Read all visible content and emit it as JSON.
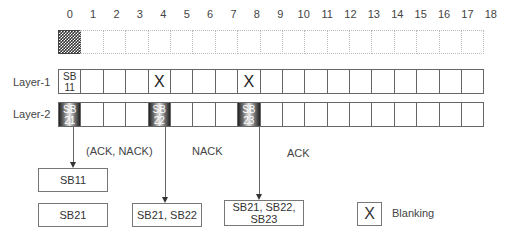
{
  "indices": [
    "0",
    "1",
    "2",
    "3",
    "4",
    "5",
    "6",
    "7",
    "8",
    "9",
    "10",
    "11",
    "12",
    "13",
    "14",
    "15",
    "16",
    "17",
    "18"
  ],
  "top_row": {
    "patterned_cell": 0,
    "patterned_label": "G"
  },
  "layers": [
    {
      "label": "Layer-1",
      "cells": [
        {
          "index": 0,
          "type": "sb",
          "line1": "SB",
          "line2": "11"
        },
        {
          "index": 4,
          "type": "blank",
          "mark": "X"
        },
        {
          "index": 8,
          "type": "blank",
          "mark": "X"
        }
      ]
    },
    {
      "label": "Layer-2",
      "cells": [
        {
          "index": 0,
          "type": "sb-shaded",
          "line1": "SB",
          "line2": "21"
        },
        {
          "index": 4,
          "type": "sb-shaded",
          "line1": "SB",
          "line2": "22"
        },
        {
          "index": 8,
          "type": "sb-shaded",
          "line1": "SB",
          "line2": "23"
        }
      ]
    }
  ],
  "feedback": [
    {
      "label": "(ACK, NACK)"
    },
    {
      "label": "NACK"
    },
    {
      "label": "ACK"
    }
  ],
  "buffers": [
    {
      "text": "SB11"
    },
    {
      "text": "SB21"
    },
    {
      "text": "SB21, SB22"
    },
    {
      "line1": "SB21, SB22,",
      "line2": "SB23"
    }
  ],
  "legend": {
    "mark": "X",
    "label": "Blanking"
  }
}
